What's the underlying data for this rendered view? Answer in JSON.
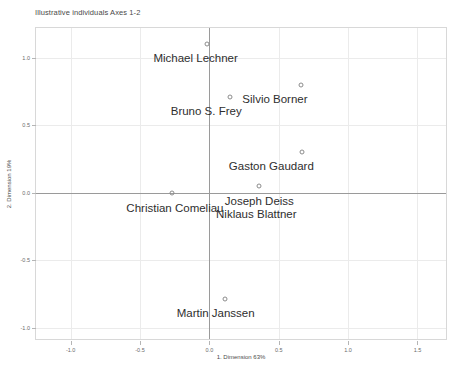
{
  "chart_data": {
    "type": "scatter",
    "title": "Illustrative individuals Axes 1-2",
    "xlabel": "1. Dimension 63%",
    "ylabel": "2. Dimension 19%",
    "xlim": [
      -1.25,
      1.72
    ],
    "ylim": [
      -1.1,
      1.22
    ],
    "grid": true,
    "legend": "none",
    "x_ticks": [
      {
        "value": -1.0,
        "label": "-1.0"
      },
      {
        "value": -0.5,
        "label": "-0.5"
      },
      {
        "value": 0.0,
        "label": "0.0"
      },
      {
        "value": 0.5,
        "label": "0.5"
      },
      {
        "value": 1.0,
        "label": "1.0"
      },
      {
        "value": 1.5,
        "label": "1.5"
      }
    ],
    "y_ticks": [
      {
        "value": 1.0,
        "label": "1.0"
      },
      {
        "value": 0.5,
        "label": "0.5"
      },
      {
        "value": 0.0,
        "label": "0.0"
      },
      {
        "value": -0.5,
        "label": "-0.5"
      },
      {
        "value": -1.0,
        "label": "-1.0"
      }
    ],
    "zero_lines": {
      "x": 0.0,
      "y": 0.0
    },
    "points": [
      {
        "label": "Michael Lechner",
        "x": -0.02,
        "y": 1.1,
        "label_dx": -11,
        "label_dy": 8
      },
      {
        "label": "Bruno S. Frey",
        "x": 0.15,
        "y": 0.71,
        "label_dx": -24,
        "label_dy": 8
      },
      {
        "label": "Silvio Borner",
        "x": 0.66,
        "y": 0.8,
        "label_dx": -26,
        "label_dy": 8
      },
      {
        "label": "Gaston Gaudard",
        "x": 0.67,
        "y": 0.3,
        "label_dx": -31,
        "label_dy": 8
      },
      {
        "label": "Christian Comeliau",
        "x": -0.27,
        "y": 0.0,
        "label_dx": 3,
        "label_dy": 9
      },
      {
        "label": "Joseph Deiss",
        "x": 0.36,
        "y": 0.05,
        "label_dx": 0,
        "label_dy": 9
      },
      {
        "label": "Niklaus Blattner",
        "x": 0.36,
        "y": 0.05,
        "label_dx": -3,
        "label_dy": 22
      },
      {
        "label": "Martin Janssen",
        "x": 0.11,
        "y": -0.79,
        "label_dx": -9,
        "label_dy": 8
      }
    ]
  },
  "colors": {
    "frame": "#d8d8d8",
    "grid": "#ebebeb",
    "zero_line": "#9a9a9a",
    "marker_stroke": "#8c8c8c",
    "text": "#2e2e2e",
    "axis_text": "#6a6a6a",
    "background": "#ffffff"
  }
}
